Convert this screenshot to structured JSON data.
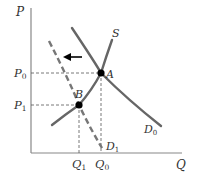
{
  "diagram": {
    "type": "supply-demand",
    "axes": {
      "y_label": "P",
      "x_label": "Q"
    },
    "price_levels": [
      {
        "label": "P",
        "sub": "0"
      },
      {
        "label": "P",
        "sub": "1"
      }
    ],
    "quantity_levels": [
      {
        "label": "Q",
        "sub": "1"
      },
      {
        "label": "Q",
        "sub": "0"
      }
    ],
    "curves": {
      "supply": {
        "label": "S"
      },
      "demand_original": {
        "label": "D",
        "sub": "0"
      },
      "demand_shifted": {
        "label": "D",
        "sub": "1",
        "style": "dashed"
      }
    },
    "points": {
      "A": {
        "label": "A"
      },
      "B": {
        "label": "B"
      }
    },
    "shift_arrow": {
      "direction": "left"
    },
    "colors": {
      "curve": "#666666",
      "axis": "#888888",
      "point": "#000000",
      "guide": "#555555"
    }
  }
}
